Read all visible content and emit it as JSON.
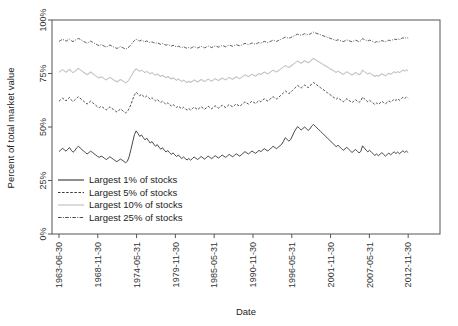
{
  "chart_data": {
    "type": "line",
    "title": "",
    "xlabel": "Date",
    "ylabel": "Percent of total market value",
    "grid": false,
    "legend_position": "inside-bottom-left",
    "ylim": [
      0,
      100
    ],
    "ytick_labels": [
      "0%",
      "25%",
      "50%",
      "75%",
      "100%"
    ],
    "ytick_values": [
      0,
      25,
      50,
      75,
      100
    ],
    "xtick_labels": [
      "1963-06-30",
      "1968-11-30",
      "1974-05-31",
      "1979-11-30",
      "1985-05-31",
      "1990-11-30",
      "1996-05-31",
      "2001-11-30",
      "2007-05-31",
      "2012-11-30"
    ],
    "series": [
      {
        "name": "Largest 1% of stocks",
        "color": "#333333",
        "style": "solid",
        "values": [
          38.5,
          39.2,
          40.1,
          39.4,
          38.7,
          39.6,
          40.4,
          39.1,
          38.2,
          38.9,
          40.2,
          41.0,
          40.3,
          39.5,
          38.8,
          38.1,
          37.4,
          38.0,
          38.7,
          38.2,
          37.5,
          36.9,
          36.2,
          35.8,
          36.4,
          36.0,
          35.3,
          34.8,
          35.4,
          36.1,
          35.5,
          34.9,
          34.3,
          33.8,
          34.4,
          35.0,
          34.5,
          33.9,
          33.3,
          34.0,
          36.2,
          39.5,
          43.0,
          46.4,
          48.2,
          47.0,
          45.6,
          46.3,
          45.1,
          44.0,
          44.8,
          43.6,
          42.5,
          43.2,
          42.0,
          41.0,
          41.8,
          40.6,
          39.6,
          40.3,
          39.2,
          38.3,
          39.0,
          38.0,
          37.2,
          37.9,
          37.0,
          36.2,
          36.9,
          36.0,
          35.3,
          36.0,
          35.2,
          34.6,
          35.3,
          34.5,
          35.2,
          36.0,
          35.4,
          34.8,
          35.5,
          36.2,
          35.6,
          35.0,
          35.7,
          36.4,
          35.8,
          35.2,
          35.9,
          36.6,
          36.0,
          35.5,
          36.2,
          36.9,
          36.3,
          35.8,
          36.5,
          37.2,
          36.6,
          36.1,
          36.8,
          37.5,
          36.9,
          36.4,
          37.1,
          37.8,
          38.5,
          37.9,
          37.4,
          38.1,
          38.8,
          38.2,
          37.7,
          38.4,
          39.1,
          38.5,
          39.2,
          39.9,
          39.3,
          38.8,
          39.5,
          40.2,
          41.0,
          40.4,
          39.9,
          40.6,
          41.3,
          42.0,
          43.5,
          45.0,
          44.2,
          43.4,
          44.1,
          45.8,
          47.6,
          49.0,
          50.2,
          49.4,
          48.6,
          49.3,
          50.0,
          49.2,
          48.4,
          49.1,
          50.4,
          51.2,
          50.4,
          49.6,
          48.8,
          48.0,
          47.2,
          46.4,
          45.6,
          44.8,
          44.0,
          43.2,
          42.4,
          41.6,
          40.8,
          41.5,
          40.7,
          39.9,
          39.1,
          39.8,
          40.5,
          39.7,
          38.9,
          38.1,
          38.8,
          39.5,
          38.7,
          37.9,
          38.6,
          41.2,
          40.2,
          39.2,
          38.4,
          39.1,
          38.3,
          37.5,
          36.7,
          37.4,
          36.6,
          37.3,
          38.0,
          37.2,
          36.4,
          37.1,
          37.8,
          37.0,
          37.7,
          38.4,
          37.6,
          38.3,
          37.5,
          38.2,
          38.9,
          38.1,
          38.8,
          38.0
        ]
      },
      {
        "name": "Largest 5% of stocks",
        "color": "#3a3a3a",
        "style": "dashed",
        "values": [
          62.0,
          62.8,
          63.5,
          62.9,
          62.2,
          63.0,
          63.8,
          62.6,
          61.9,
          62.6,
          63.4,
          64.2,
          63.5,
          62.8,
          62.1,
          61.4,
          60.7,
          61.4,
          62.1,
          61.5,
          60.8,
          60.1,
          59.4,
          59.0,
          59.7,
          59.2,
          58.5,
          58.0,
          58.7,
          59.4,
          58.8,
          58.2,
          57.6,
          57.0,
          57.7,
          58.4,
          57.8,
          57.2,
          56.6,
          57.3,
          58.6,
          60.5,
          62.8,
          65.0,
          66.2,
          65.4,
          64.6,
          65.3,
          64.5,
          63.8,
          64.5,
          63.7,
          63.0,
          63.7,
          62.9,
          62.2,
          62.9,
          62.1,
          61.4,
          62.1,
          61.3,
          60.6,
          61.3,
          60.5,
          59.8,
          60.5,
          59.8,
          59.1,
          59.8,
          59.1,
          58.5,
          59.2,
          58.5,
          57.9,
          58.6,
          57.9,
          58.6,
          59.3,
          58.7,
          58.1,
          58.8,
          59.5,
          58.9,
          58.3,
          59.0,
          59.7,
          59.1,
          58.5,
          59.2,
          59.9,
          59.3,
          58.8,
          59.5,
          60.2,
          59.6,
          59.1,
          59.8,
          60.5,
          59.9,
          59.4,
          60.1,
          60.8,
          60.2,
          59.7,
          60.4,
          61.1,
          61.8,
          61.2,
          60.7,
          61.4,
          62.1,
          61.5,
          61.0,
          61.7,
          62.4,
          61.8,
          62.5,
          63.2,
          62.6,
          62.1,
          62.8,
          63.5,
          64.2,
          63.6,
          63.1,
          63.8,
          64.5,
          65.2,
          66.0,
          66.8,
          66.2,
          65.6,
          66.3,
          67.0,
          67.8,
          68.6,
          69.4,
          68.8,
          68.2,
          68.9,
          69.6,
          69.0,
          68.4,
          69.1,
          70.2,
          70.8,
          70.2,
          69.6,
          69.0,
          68.4,
          67.8,
          67.2,
          66.6,
          66.0,
          65.4,
          64.8,
          64.2,
          63.6,
          63.0,
          63.7,
          63.0,
          62.4,
          61.8,
          62.5,
          63.2,
          62.6,
          62.0,
          61.4,
          62.1,
          62.8,
          62.1,
          61.5,
          62.2,
          64.0,
          63.2,
          62.5,
          61.8,
          62.5,
          61.8,
          61.2,
          60.5,
          61.2,
          60.6,
          61.3,
          62.0,
          61.4,
          60.8,
          61.5,
          62.2,
          61.6,
          62.3,
          63.0,
          62.4,
          63.1,
          62.5,
          63.2,
          63.9,
          63.3,
          64.0,
          63.4
        ]
      },
      {
        "name": "Largest 10% of stocks",
        "color": "#c4c4c4",
        "style": "solid-light",
        "values": [
          75.5,
          76.2,
          76.8,
          76.2,
          75.6,
          76.3,
          77.0,
          76.0,
          75.4,
          76.0,
          76.7,
          77.4,
          76.8,
          76.2,
          75.6,
          75.0,
          74.4,
          75.0,
          75.7,
          75.1,
          74.5,
          73.9,
          73.3,
          72.9,
          73.5,
          73.1,
          72.5,
          72.0,
          72.6,
          73.2,
          72.7,
          72.1,
          71.6,
          71.0,
          71.6,
          72.2,
          71.7,
          71.2,
          70.6,
          71.2,
          72.2,
          73.6,
          75.0,
          76.4,
          77.2,
          76.6,
          76.0,
          76.6,
          76.0,
          75.4,
          76.0,
          75.4,
          74.8,
          75.4,
          74.8,
          74.2,
          74.8,
          74.2,
          73.6,
          74.2,
          73.6,
          73.0,
          73.6,
          73.0,
          72.4,
          73.0,
          72.4,
          71.8,
          72.4,
          71.8,
          71.3,
          71.9,
          71.3,
          70.8,
          71.4,
          70.8,
          71.4,
          72.0,
          71.5,
          71.0,
          71.6,
          72.2,
          71.7,
          71.2,
          71.8,
          72.4,
          71.9,
          71.4,
          72.0,
          72.6,
          72.1,
          71.7,
          72.3,
          72.9,
          72.4,
          72.0,
          72.6,
          73.2,
          72.7,
          72.3,
          72.9,
          73.5,
          73.0,
          72.6,
          73.2,
          73.8,
          74.4,
          73.9,
          73.5,
          74.1,
          74.7,
          74.2,
          73.8,
          74.4,
          75.0,
          74.5,
          75.1,
          75.7,
          75.2,
          74.8,
          75.4,
          76.0,
          76.6,
          76.1,
          75.7,
          76.3,
          76.9,
          77.5,
          78.1,
          78.7,
          78.2,
          77.8,
          78.4,
          79.0,
          79.6,
          80.2,
          80.8,
          80.3,
          79.8,
          80.4,
          81.0,
          80.5,
          80.0,
          80.6,
          81.4,
          82.0,
          81.5,
          81.0,
          80.5,
          80.0,
          79.5,
          79.0,
          78.5,
          78.0,
          77.5,
          77.0,
          76.5,
          76.0,
          75.5,
          76.1,
          75.6,
          75.1,
          74.6,
          75.2,
          75.8,
          75.3,
          74.8,
          74.3,
          74.9,
          75.5,
          74.9,
          74.4,
          75.0,
          76.6,
          75.9,
          75.3,
          74.7,
          75.3,
          74.7,
          74.2,
          73.6,
          74.2,
          73.7,
          74.3,
          74.9,
          74.4,
          73.9,
          74.5,
          75.1,
          74.6,
          75.2,
          75.8,
          75.3,
          75.9,
          75.4,
          76.0,
          76.6,
          76.1,
          76.7,
          76.2
        ]
      },
      {
        "name": "Largest 25% of stocks",
        "color": "#4a4a4a",
        "style": "dashdot",
        "values": [
          90.0,
          90.5,
          91.0,
          90.6,
          90.1,
          90.6,
          91.1,
          90.4,
          89.9,
          90.4,
          90.9,
          91.4,
          91.0,
          90.5,
          90.0,
          89.6,
          89.1,
          89.6,
          90.1,
          89.7,
          89.2,
          88.8,
          88.3,
          88.0,
          88.5,
          88.1,
          87.7,
          87.3,
          87.8,
          88.3,
          87.9,
          87.5,
          87.1,
          86.7,
          87.1,
          87.6,
          87.2,
          86.8,
          86.4,
          86.8,
          87.5,
          88.5,
          89.5,
          90.4,
          91.0,
          90.6,
          90.2,
          90.6,
          90.2,
          89.8,
          90.2,
          89.8,
          89.4,
          89.8,
          89.4,
          89.0,
          89.4,
          89.0,
          88.6,
          89.0,
          88.6,
          88.2,
          88.6,
          88.2,
          87.8,
          88.2,
          87.8,
          87.4,
          87.8,
          87.4,
          87.1,
          87.5,
          87.1,
          86.8,
          87.2,
          86.8,
          87.2,
          87.6,
          87.3,
          86.9,
          87.3,
          87.7,
          87.4,
          87.0,
          87.4,
          87.8,
          87.5,
          87.1,
          87.5,
          87.9,
          87.6,
          87.3,
          87.7,
          88.1,
          87.8,
          87.5,
          87.9,
          88.3,
          88.0,
          87.7,
          88.1,
          88.5,
          88.2,
          87.9,
          88.3,
          88.7,
          89.1,
          88.8,
          88.5,
          88.9,
          89.3,
          89.0,
          88.7,
          89.1,
          89.5,
          89.2,
          89.6,
          90.0,
          89.7,
          89.4,
          89.8,
          90.2,
          90.6,
          90.3,
          90.0,
          90.4,
          90.8,
          91.2,
          91.6,
          92.0,
          91.7,
          91.4,
          91.8,
          92.2,
          92.6,
          93.0,
          93.4,
          93.1,
          92.8,
          93.2,
          93.6,
          93.3,
          93.0,
          93.4,
          93.9,
          94.3,
          94.0,
          93.7,
          93.4,
          93.1,
          92.8,
          92.5,
          92.2,
          91.9,
          91.6,
          91.3,
          91.0,
          90.7,
          90.4,
          90.8,
          90.5,
          90.2,
          89.9,
          90.3,
          90.7,
          90.4,
          90.1,
          89.8,
          90.2,
          90.6,
          90.2,
          89.9,
          90.3,
          91.3,
          90.9,
          90.5,
          90.2,
          90.6,
          90.2,
          89.9,
          89.5,
          89.9,
          89.6,
          90.0,
          90.4,
          90.1,
          89.8,
          90.2,
          90.6,
          90.3,
          90.7,
          91.1,
          90.8,
          91.2,
          90.9,
          91.3,
          91.7,
          91.4,
          91.8,
          91.5
        ]
      }
    ]
  },
  "legend": {
    "items": [
      {
        "label": "Largest 1% of stocks"
      },
      {
        "label": "Largest 5% of stocks"
      },
      {
        "label": "Largest 10% of stocks"
      },
      {
        "label": "Largest 25% of stocks"
      }
    ]
  }
}
